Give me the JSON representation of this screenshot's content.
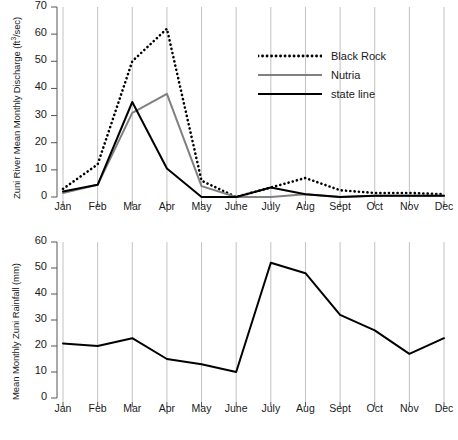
{
  "figure": {
    "background": "#ffffff",
    "panels": [
      "discharge",
      "rainfall"
    ]
  },
  "chart_data": [
    {
      "id": "discharge",
      "type": "line",
      "title": "",
      "xlabel": "",
      "ylabel": "Zuni River Mean Monthly Discharge (ft3/sec)",
      "ylabel_parts": {
        "pre": "Zuni River Mean Monthly Discharge (ft",
        "sup": "3",
        "post": "/sec)"
      },
      "categories": [
        "Jan",
        "Feb",
        "Mar",
        "Apr",
        "May",
        "June",
        "July",
        "Aug",
        "Sept",
        "Oct",
        "Nov",
        "Dec"
      ],
      "ylim": [
        0,
        70
      ],
      "yticks": [
        0,
        10,
        20,
        30,
        40,
        50,
        60,
        70
      ],
      "ytick_labels": [
        "0",
        "10",
        "20",
        "30",
        "40",
        "50",
        "60",
        "70"
      ],
      "grid": "vertical",
      "legend_position": "upper-right-inside",
      "series": [
        {
          "name": "Black Rock",
          "style": "dotted",
          "color": "#000000",
          "values": [
            3,
            12,
            50,
            62,
            6,
            0,
            3.5,
            7,
            2.5,
            1.5,
            1.5,
            1
          ]
        },
        {
          "name": "Nutria",
          "style": "solid",
          "color": "#808080",
          "values": [
            1.5,
            4.5,
            31,
            38,
            4,
            0,
            0,
            1,
            0,
            0.5,
            0.5,
            0.5
          ]
        },
        {
          "name": "state line",
          "style": "solid",
          "color": "#000000",
          "values": [
            2,
            4.5,
            35,
            10.5,
            0,
            0,
            3.5,
            1,
            0,
            0.5,
            0.5,
            0.5
          ]
        }
      ]
    },
    {
      "id": "rainfall",
      "type": "line",
      "title": "",
      "xlabel": "",
      "ylabel": "Mean Monthly Zuni Rainfall (mm)",
      "categories": [
        "Jan",
        "Feb",
        "Mar",
        "Apr",
        "May",
        "June",
        "July",
        "Aug",
        "Sept",
        "Oct",
        "Nov",
        "Dec"
      ],
      "ylim": [
        0,
        60
      ],
      "yticks": [
        0,
        10,
        20,
        30,
        40,
        50,
        60
      ],
      "ytick_labels": [
        "0",
        "10",
        "20",
        "30",
        "40",
        "50",
        "60"
      ],
      "grid": "vertical",
      "legend_position": "none",
      "series": [
        {
          "name": "Zuni rainfall",
          "style": "solid",
          "color": "#000000",
          "values": [
            21,
            20,
            23,
            15,
            13,
            10,
            52,
            48,
            32,
            26,
            17,
            23
          ]
        }
      ]
    }
  ]
}
